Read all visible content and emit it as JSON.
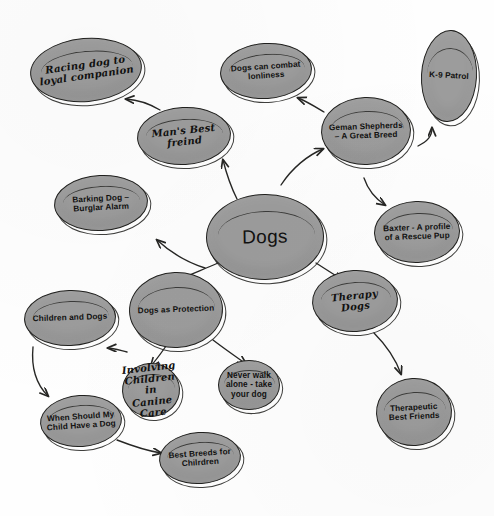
{
  "document": {
    "title": "Dogs Mind Map",
    "type": "hand-drawn mind map / concept map",
    "background_color": "#fefefe",
    "node_fill_color": "#9c9c9c",
    "node_stroke_color": "#20201e",
    "text_color": "#111110"
  },
  "nodes": [
    {
      "id": "dogs",
      "label": "Dogs",
      "style": "hub",
      "cx": 265,
      "cy": 237,
      "w": 118,
      "h": 86,
      "rot": -1
    },
    {
      "id": "racing-dog",
      "label": "Racing dog to loyal companion",
      "style": "script",
      "cx": 86,
      "cy": 70,
      "w": 112,
      "h": 64,
      "rot": -5
    },
    {
      "id": "mans-best-friend",
      "label": "Man's Best freind",
      "style": "script",
      "cx": 184,
      "cy": 136,
      "w": 94,
      "h": 58,
      "rot": -3
    },
    {
      "id": "dogs-combat-loneliness",
      "label": "Dogs can combat lonliness",
      "style": "print",
      "cx": 266,
      "cy": 71,
      "w": 92,
      "h": 56,
      "rot": -4
    },
    {
      "id": "german-shepherds",
      "label": "Geman Shepherds – A Great Breed",
      "style": "print",
      "cx": 366,
      "cy": 131,
      "w": 90,
      "h": 68,
      "rot": -2
    },
    {
      "id": "k9-patrol",
      "label": "K-9 Patrol",
      "style": "print",
      "cx": 449,
      "cy": 76,
      "w": 56,
      "h": 92,
      "rot": 3
    },
    {
      "id": "baxter-rescue-pup",
      "label": "Baxter - A profile of a Rescue Pup",
      "style": "print",
      "cx": 417,
      "cy": 232,
      "w": 86,
      "h": 62,
      "rot": -2
    },
    {
      "id": "barking-dog",
      "label": "Barking Dog – Burglar Alarm",
      "style": "print",
      "cx": 101,
      "cy": 203,
      "w": 94,
      "h": 56,
      "rot": -3
    },
    {
      "id": "dogs-as-protection",
      "label": "Dogs as Protection",
      "style": "print",
      "cx": 176,
      "cy": 310,
      "w": 94,
      "h": 76,
      "rot": -2
    },
    {
      "id": "children-and-dogs",
      "label": "Children and Dogs",
      "style": "print",
      "cx": 70,
      "cy": 318,
      "w": 92,
      "h": 56,
      "rot": -2
    },
    {
      "id": "when-should-my-child",
      "label": "When Should My Child Have a Dog",
      "style": "print",
      "cx": 81,
      "cy": 421,
      "w": 82,
      "h": 52,
      "rot": -4
    },
    {
      "id": "involving-children",
      "label": "Involving Children in Canine Care",
      "style": "script",
      "cx": 151,
      "cy": 390,
      "w": 58,
      "h": 54,
      "rot": -3
    },
    {
      "id": "never-walk-alone",
      "label": "Never walk alone - take your dog",
      "style": "print",
      "cx": 249,
      "cy": 385,
      "w": 62,
      "h": 50,
      "rot": 0
    },
    {
      "id": "best-breeds",
      "label": "Best Breeds for Chilrdren",
      "style": "print",
      "cx": 200,
      "cy": 458,
      "w": 82,
      "h": 52,
      "rot": -4
    },
    {
      "id": "therapy-dogs",
      "label": "Therapy Dogs",
      "style": "script",
      "cx": 355,
      "cy": 301,
      "w": 86,
      "h": 62,
      "rot": -3
    },
    {
      "id": "therapeutic-best-friends",
      "label": "Therapeutic Best Friends",
      "style": "print",
      "cx": 414,
      "cy": 412,
      "w": 76,
      "h": 68,
      "rot": -3
    }
  ],
  "edges": [
    {
      "id": "dogs-to-mans-best-friend",
      "from": "dogs",
      "to": "mans-best-friend",
      "path": "M 237 199 C 229 183 226 172 223 160",
      "arrow": true
    },
    {
      "id": "mans-best-friend-to-racing-dog",
      "from": "mans-best-friend",
      "to": "racing-dog",
      "path": "M 160 110 C 150 104 140 100 126 99",
      "arrow": true
    },
    {
      "id": "dogs-to-german-shepherds",
      "from": "dogs",
      "to": "german-shepherds",
      "path": "M 281 185 C 292 168 308 155 323 149",
      "arrow": true
    },
    {
      "id": "german-shepherds-to-combat-loneliness",
      "from": "german-shepherds",
      "to": "dogs-combat-loneliness",
      "path": "M 324 112 C 314 106 306 101 298 98",
      "arrow": true
    },
    {
      "id": "german-shepherds-to-k9",
      "from": "german-shepherds",
      "to": "k9-patrol",
      "path": "M 418 146 C 428 141 432 136 432 128",
      "arrow": true
    },
    {
      "id": "german-shepherds-to-baxter",
      "from": "german-shepherds",
      "to": "baxter-rescue-pup",
      "path": "M 364 178 C 368 190 376 199 385 205",
      "arrow": true
    },
    {
      "id": "dogs-to-barking-dog",
      "from": "dogs",
      "to": "barking-dog",
      "path": "M 205 268 C 186 262 170 252 157 240",
      "arrow": true
    },
    {
      "id": "dogs-to-protection",
      "from": "dogs",
      "to": "dogs-as-protection",
      "path": "M 218 263 C 202 270 186 276 174 282",
      "arrow": true
    },
    {
      "id": "dogs-to-therapy",
      "from": "dogs",
      "to": "therapy-dogs",
      "path": "M 316 263 C 327 270 336 276 343 280",
      "arrow": true
    },
    {
      "id": "protection-to-children-and-dogs",
      "from": "dogs-as-protection",
      "to": "children-and-dogs",
      "path": "M 127 352 C 119 350 113 348 108 348",
      "arrow": true
    },
    {
      "id": "protection-to-involving-children",
      "from": "dogs-as-protection",
      "to": "involving-children",
      "path": "M 166 346 C 160 355 155 361 151 366",
      "arrow": true
    },
    {
      "id": "protection-to-never-walk",
      "from": "dogs-as-protection",
      "to": "never-walk-alone",
      "path": "M 213 340 C 226 350 238 358 246 364",
      "arrow": true
    },
    {
      "id": "children-and-dogs-to-when-should",
      "from": "children-and-dogs",
      "to": "when-should-my-child",
      "path": "M 33 347 C 31 368 37 385 48 396",
      "arrow": true
    },
    {
      "id": "when-should-to-best-breeds",
      "from": "when-should-my-child",
      "to": "best-breeds",
      "path": "M 117 440 C 135 447 148 451 161 453",
      "arrow": true
    },
    {
      "id": "therapy-to-therapeutic",
      "from": "therapy-dogs",
      "to": "therapeutic-best-friends",
      "path": "M 374 333 C 388 347 396 360 401 374",
      "arrow": true
    }
  ]
}
